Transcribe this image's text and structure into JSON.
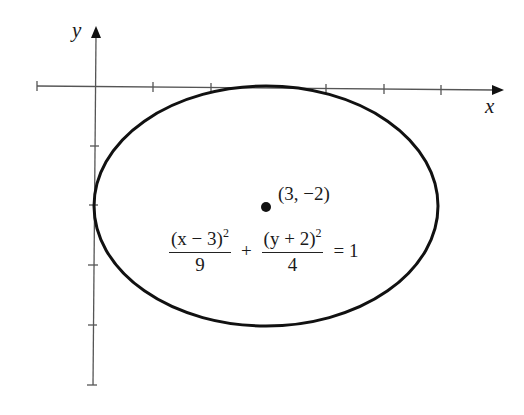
{
  "diagram": {
    "axes": {
      "x_label": "x",
      "y_label": "y",
      "x_ticks": [
        -1,
        0,
        1,
        2,
        3,
        4,
        5,
        6
      ],
      "y_ticks": [
        0,
        -1,
        -2,
        -3,
        -4,
        -5
      ]
    },
    "ellipse": {
      "center": [
        3,
        -2
      ],
      "semi_axis_x": 3,
      "semi_axis_y": 2,
      "stroke_color": "#111111"
    },
    "center_point": {
      "label": "(3, −2)",
      "color": "#111111"
    },
    "equation": {
      "term1_numerator_base": "(x − 3)",
      "term1_exponent": "2",
      "term1_denominator": "9",
      "plus": "+",
      "term2_numerator_base": "(y + 2)",
      "term2_exponent": "2",
      "term2_denominator": "4",
      "equals": "= 1"
    }
  }
}
